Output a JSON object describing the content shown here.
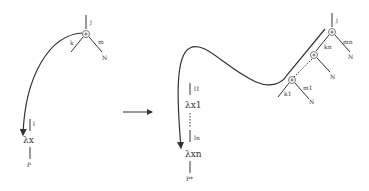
{
  "left_graph": {
    "top_node": {
      "label_in": "j",
      "label_left": "k",
      "label_right": "m",
      "right_leaf": "N"
    },
    "lambda": {
      "edge_label": "l",
      "label": "λx"
    },
    "bottom": "P"
  },
  "arrow": {
    "direction": "right"
  },
  "right_graph": {
    "top_node": {
      "label_in": "j",
      "label_left": "kn",
      "label_right": "mn",
      "right_leaf": "N"
    },
    "middle_node": {
      "right_leaf": "N"
    },
    "bottom_node": {
      "label_left": "k1",
      "label_right": "m1",
      "right_leaf": "N"
    },
    "lambda_first": {
      "edge_label": "l1",
      "label": "λx1"
    },
    "lambda_last": {
      "edge_label": "ln",
      "label": "λxn"
    },
    "bottom": "P*"
  }
}
